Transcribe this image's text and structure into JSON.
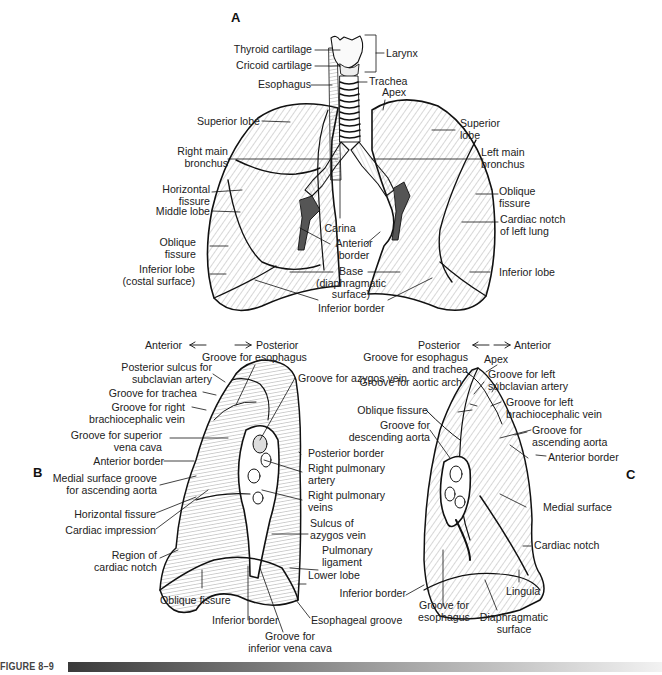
{
  "figure": {
    "caption": "FIGURE 8–9",
    "panels": {
      "A": {
        "letter": "A",
        "labels": {
          "thyroid_cartilage": "Thyroid cartilage",
          "cricoid_cartilage": "Cricoid cartilage",
          "larynx": "Larynx",
          "esophagus": "Esophagus",
          "trachea": "Trachea",
          "apex": "Apex",
          "superior_lobe_right": "Superior lobe",
          "superior_lobe_left_1": "Superior",
          "superior_lobe_left_2": "lobe",
          "right_main_bronchus_1": "Right main",
          "right_main_bronchus_2": "bronchus",
          "left_main_bronchus_1": "Left main",
          "left_main_bronchus_2": "bronchus",
          "horizontal_fissure_1": "Horizontal",
          "horizontal_fissure_2": "fissure",
          "middle_lobe": "Middle lobe",
          "oblique_fissure_right_1": "Oblique",
          "oblique_fissure_right_2": "fissure",
          "oblique_fissure_left_1": "Oblique",
          "oblique_fissure_left_2": "fissure",
          "cardiac_notch_1": "Cardiac notch",
          "cardiac_notch_2": "of left lung",
          "carina": "Carina",
          "anterior_border_1": "Anterior",
          "anterior_border_2": "border",
          "inferior_lobe_right_1": "Inferior lobe",
          "inferior_lobe_right_2": "(costal surface)",
          "inferior_lobe_left": "Inferior lobe",
          "base_1": "Base",
          "base_2": "(diaphragmatic",
          "base_3": "surface)",
          "inferior_border": "Inferior border"
        }
      },
      "B": {
        "letter": "B",
        "orientation": {
          "left": "Anterior",
          "right": "Posterior"
        },
        "labels": {
          "groove_esophagus": "Groove for esophagus",
          "posterior_sulcus_1": "Posterior sulcus for",
          "posterior_sulcus_2": "subclavian artery",
          "groove_trachea": "Groove for trachea",
          "groove_right_brachio_1": "Groove for right",
          "groove_right_brachio_2": "brachiocephalic vein",
          "groove_svc_1": "Groove for superior",
          "groove_svc_2": "vena cava",
          "anterior_border": "Anterior border",
          "medial_groove_1": "Medial surface groove",
          "medial_groove_2": "for ascending aorta",
          "horizontal_fissure": "Horizontal fissure",
          "cardiac_impression": "Cardiac impression",
          "region_cardiac_notch_1": "Region of",
          "region_cardiac_notch_2": "cardiac notch",
          "oblique_fissure": "Oblique fissure",
          "inferior_border": "Inferior border",
          "groove_ivc_1": "Groove for",
          "groove_ivc_2": "inferior vena cava",
          "esophageal_groove": "Esophageal groove",
          "groove_azygos": "Groove for azygos vein",
          "posterior_border": "Posterior border",
          "right_pulm_artery_1": "Right pulmonary",
          "right_pulm_artery_2": "artery",
          "right_pulm_veins_1": "Right pulmonary",
          "right_pulm_veins_2": "veins",
          "sulcus_azygos_1": "Sulcus of",
          "sulcus_azygos_2": "azygos vein",
          "pulm_ligament_1": "Pulmonary",
          "pulm_ligament_2": "ligament",
          "lower_lobe": "Lower lobe"
        }
      },
      "C": {
        "letter": "C",
        "orientation": {
          "left": "Posterior",
          "right": "Anterior"
        },
        "labels": {
          "groove_esoph_trachea_1": "Groove for esophagus",
          "groove_esoph_trachea_2": "and trachea",
          "groove_aortic_arch": "Groove for aortic arch",
          "oblique_fissure": "Oblique fissure",
          "groove_desc_aorta_1": "Groove for",
          "groove_desc_aorta_2": "descending aorta",
          "apex": "Apex",
          "groove_left_subclavian_1": "Groove for left",
          "groove_left_subclavian_2": "subclavian artery",
          "groove_left_brachio_1": "Groove for left",
          "groove_left_brachio_2": "brachiocephalic vein",
          "groove_asc_aorta_1": "Groove for",
          "groove_asc_aorta_2": "ascending aorta",
          "anterior_border": "Anterior border",
          "medial_surface": "Medial surface",
          "cardiac_notch": "Cardiac notch",
          "lingula": "Lingula",
          "inferior_border": "Inferior border",
          "groove_esophagus_1": "Groove for",
          "groove_esophagus_2": "esophagus",
          "diaphragmatic_1": "Diaphragmatic",
          "diaphragmatic_2": "surface"
        }
      }
    }
  }
}
